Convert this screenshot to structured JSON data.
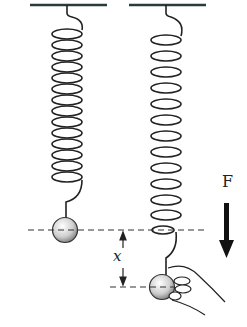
{
  "diagram": {
    "labels": {
      "force": "F",
      "displacement": "x"
    },
    "left_system": {
      "state": "equilibrium",
      "coils": 13,
      "ball": "sphere"
    },
    "right_system": {
      "state": "stretched",
      "coils": 12,
      "ball": "sphere held by hand"
    },
    "colors": {
      "stroke": "#222222",
      "ceiling": "#2a3a3a",
      "dashed": "#333333"
    }
  }
}
